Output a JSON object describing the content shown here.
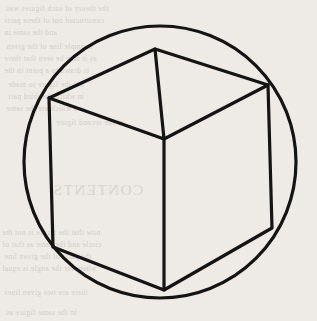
{
  "figure": {
    "caption": "",
    "background_color": "#eeebe6",
    "ink_color": "#141414",
    "paper_texture": "scanned-book-page",
    "canvas": {
      "width": 317,
      "height": 321
    }
  },
  "shapes": {
    "circle": {
      "name": "circumscribing-circle",
      "cx": 160,
      "cy": 162,
      "r": 136,
      "stroke": "#141414",
      "stroke_width": 3.2,
      "fill": "none"
    },
    "cube": {
      "name": "necker-cube",
      "stroke": "#141414",
      "stroke_width": 3.2,
      "fill": "none",
      "vertices": {
        "top": [
          155,
          49
        ],
        "upper_left": [
          49,
          98
        ],
        "upper_right": [
          268,
          85
        ],
        "center": [
          164,
          139
        ],
        "lower_left": [
          53,
          247
        ],
        "lower_right": [
          272,
          228
        ],
        "bottom": [
          164,
          290
        ]
      },
      "outline_path": "M 155 49 L 268 85 L 272 228 L 164 290 L 53 247 L 49 98 Z",
      "inner_edges": [
        {
          "name": "edge-top-to-center",
          "from": [
            155,
            49
          ],
          "to": [
            164,
            139
          ]
        },
        {
          "name": "edge-upper-left-to-center",
          "from": [
            49,
            98
          ],
          "to": [
            164,
            139
          ]
        },
        {
          "name": "edge-upper-right-to-center",
          "from": [
            268,
            85
          ],
          "to": [
            164,
            139
          ]
        },
        {
          "name": "edge-center-to-bottom",
          "from": [
            164,
            139
          ],
          "to": [
            164,
            290
          ]
        }
      ],
      "faces": [
        "top-face",
        "left-face",
        "right-face"
      ]
    }
  },
  "ghost_text": {
    "note": "faint show-through text from the reverse side of the page",
    "lines": [
      {
        "text": "the theory of such figures was",
        "x": 6,
        "y": 4,
        "size": "small"
      },
      {
        "text": "constructed out of these parts",
        "x": 4,
        "y": 16,
        "size": "small"
      },
      {
        "text": "and the same in",
        "x": 4,
        "y": 28,
        "size": "small"
      },
      {
        "text": "a simple line of the given",
        "x": 6,
        "y": 42,
        "size": "small"
      },
      {
        "text": "as it may be seen that there",
        "x": 4,
        "y": 54,
        "size": "small"
      },
      {
        "text": "is drawn to a point in the",
        "x": 4,
        "y": 66,
        "size": "small"
      },
      {
        "text": "but the figure so made",
        "x": 8,
        "y": 80,
        "size": "small"
      },
      {
        "text": "in which the third part",
        "x": 8,
        "y": 92,
        "size": "small"
      },
      {
        "text": "and which are the same",
        "x": 6,
        "y": 104,
        "size": "small"
      },
      {
        "text": "of the second figure",
        "x": 56,
        "y": 118,
        "size": "small"
      },
      {
        "text": "CONTENTS",
        "x": 52,
        "y": 182,
        "size": "big"
      },
      {
        "text": "now that the figure is not the",
        "x": 2,
        "y": 228,
        "size": "small"
      },
      {
        "text": "circle and the same as that of",
        "x": 2,
        "y": 240,
        "size": "small"
      },
      {
        "text": "the parts of the given line",
        "x": 4,
        "y": 252,
        "size": "small"
      },
      {
        "text": "whenever the angle is equal",
        "x": 2,
        "y": 264,
        "size": "small"
      },
      {
        "text": "there are two given lines",
        "x": 4,
        "y": 288,
        "size": "small"
      },
      {
        "text": "in the same figure as",
        "x": 6,
        "y": 308,
        "size": "small"
      }
    ]
  }
}
